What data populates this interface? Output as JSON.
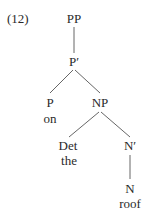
{
  "example_number": "(12)",
  "tree": {
    "root": {
      "label": "PP"
    },
    "p_bar": {
      "label": "P′"
    },
    "p": {
      "label": "P",
      "word": "on"
    },
    "np": {
      "label": "NP"
    },
    "det": {
      "label": "Det",
      "word": "the"
    },
    "n_bar": {
      "label": "N′"
    },
    "n": {
      "label": "N",
      "word": "roof"
    }
  },
  "edges": [
    [
      "PP",
      "P′"
    ],
    [
      "P′",
      "P"
    ],
    [
      "P′",
      "NP"
    ],
    [
      "NP",
      "Det"
    ],
    [
      "NP",
      "N′"
    ],
    [
      "N′",
      "N"
    ]
  ]
}
